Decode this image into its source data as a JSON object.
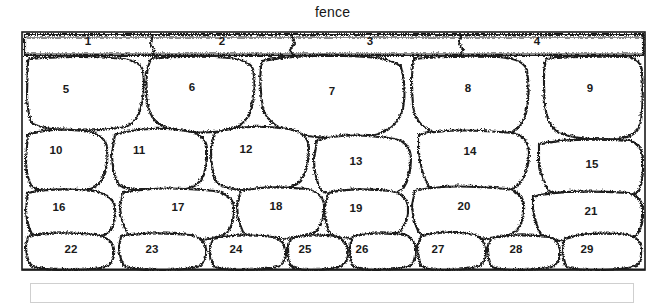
{
  "figure": {
    "caption": "fence",
    "type": "dry-stone-wall-diagram",
    "stone_count": 29,
    "ink_color": "#1a1a1a",
    "fill_color": "#ffffff",
    "background_color": "#ffffff",
    "panel_border_color": "#cfcfcf"
  },
  "rows": [
    {
      "name": "cap-row",
      "stones": [
        {
          "id": "1",
          "label": "1",
          "cx": 88,
          "cy": 42
        },
        {
          "id": "2",
          "label": "2",
          "cx": 222,
          "cy": 42
        },
        {
          "id": "3",
          "label": "3",
          "cx": 370,
          "cy": 42
        },
        {
          "id": "4",
          "label": "4",
          "cx": 537,
          "cy": 42
        }
      ]
    },
    {
      "name": "row-2",
      "stones": [
        {
          "id": "5",
          "label": "5",
          "cx": 66,
          "cy": 90
        },
        {
          "id": "6",
          "label": "6",
          "cx": 192,
          "cy": 88
        },
        {
          "id": "7",
          "label": "7",
          "cx": 332,
          "cy": 92
        },
        {
          "id": "8",
          "label": "8",
          "cx": 468,
          "cy": 89
        },
        {
          "id": "9",
          "label": "9",
          "cx": 590,
          "cy": 89
        }
      ]
    },
    {
      "name": "row-3",
      "stones": [
        {
          "id": "10",
          "label": "10",
          "cx": 56,
          "cy": 151
        },
        {
          "id": "11",
          "label": "11",
          "cx": 139,
          "cy": 151
        },
        {
          "id": "12",
          "label": "12",
          "cx": 246,
          "cy": 150
        },
        {
          "id": "13",
          "label": "13",
          "cx": 356,
          "cy": 162
        },
        {
          "id": "14",
          "label": "14",
          "cx": 470,
          "cy": 152
        },
        {
          "id": "15",
          "label": "15",
          "cx": 592,
          "cy": 165
        }
      ]
    },
    {
      "name": "row-4",
      "stones": [
        {
          "id": "16",
          "label": "16",
          "cx": 59,
          "cy": 208
        },
        {
          "id": "17",
          "label": "17",
          "cx": 178,
          "cy": 208
        },
        {
          "id": "18",
          "label": "18",
          "cx": 276,
          "cy": 207
        },
        {
          "id": "19",
          "label": "19",
          "cx": 356,
          "cy": 209
        },
        {
          "id": "20",
          "label": "20",
          "cx": 464,
          "cy": 207
        },
        {
          "id": "21",
          "label": "21",
          "cx": 591,
          "cy": 212
        }
      ]
    },
    {
      "name": "base-row",
      "stones": [
        {
          "id": "22",
          "label": "22",
          "cx": 71,
          "cy": 250
        },
        {
          "id": "23",
          "label": "23",
          "cx": 152,
          "cy": 250
        },
        {
          "id": "24",
          "label": "24",
          "cx": 236,
          "cy": 250
        },
        {
          "id": "25",
          "label": "25",
          "cx": 305,
          "cy": 250
        },
        {
          "id": "26",
          "label": "26",
          "cx": 362,
          "cy": 250
        },
        {
          "id": "27",
          "label": "27",
          "cx": 438,
          "cy": 250
        },
        {
          "id": "28",
          "label": "28",
          "cx": 516,
          "cy": 250
        },
        {
          "id": "29",
          "label": "29",
          "cx": 587,
          "cy": 250
        }
      ]
    }
  ]
}
